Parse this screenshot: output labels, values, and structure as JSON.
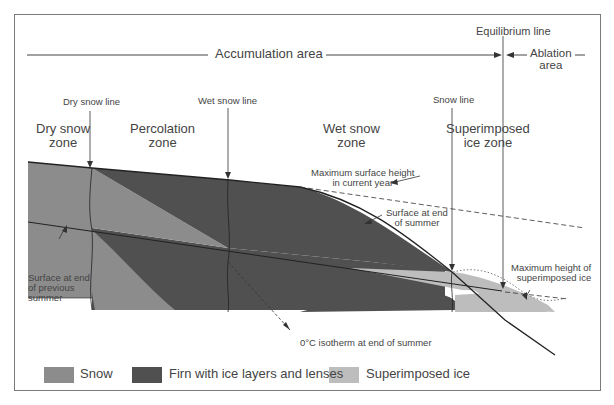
{
  "diagram": {
    "type": "glacier-zones-cross-section",
    "colors": {
      "snow": "#8c8c8c",
      "firn": "#505050",
      "superimposed_ice": "#bdbdbd",
      "frame": "#7a7a7a",
      "line": "#222222"
    },
    "areas": {
      "accumulation": "Accumulation area",
      "ablation_line1": "Ablation",
      "ablation_line2": "area",
      "equilibrium_line": "Equilibrium line"
    },
    "boundary_lines": {
      "dry_snow_line": "Dry snow line",
      "wet_snow_line": "Wet snow line",
      "snow_line": "Snow line"
    },
    "zones": {
      "dry_snow_l1": "Dry snow",
      "dry_snow_l2": "zone",
      "percolation_l1": "Percolation",
      "percolation_l2": "zone",
      "wet_snow_l1": "Wet snow",
      "wet_snow_l2": "zone",
      "superimposed_l1": "Superimposed",
      "superimposed_l2": "ice zone"
    },
    "annotations": {
      "max_surface_l1": "Maximum surface height",
      "max_surface_l2": "in current year",
      "surface_end_summer_l1": "Surface at end",
      "surface_end_summer_l2": "of summer",
      "surface_prev_l1": "Surface at end",
      "surface_prev_l2": "of previous",
      "surface_prev_l3": "summer",
      "isotherm": "0°C isotherm at end of summer",
      "max_superimposed_l1": "Maximum height of",
      "max_superimposed_l2": "superimposed ice"
    },
    "legend": [
      {
        "label": "Snow",
        "color": "#8c8c8c"
      },
      {
        "label": "Firn with ice layers and lenses",
        "color": "#505050"
      },
      {
        "label": "Superimposed ice",
        "color": "#bdbdbd"
      }
    ]
  }
}
